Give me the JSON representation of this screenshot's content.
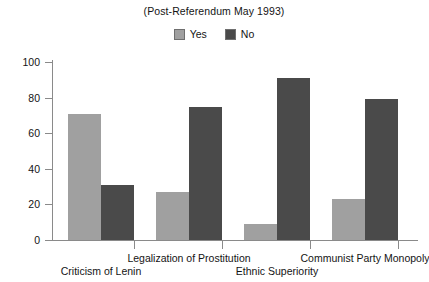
{
  "chart_data": {
    "type": "bar",
    "title": "(Post-Referendum May 1993)",
    "xlabel": "",
    "ylabel": "",
    "ylim": [
      0,
      100
    ],
    "yticks": [
      0,
      20,
      40,
      60,
      80,
      100
    ],
    "grid": false,
    "legend_position": "top-center",
    "categories": [
      "Criticism of Lenin",
      "Legalization of Prostitution",
      "Ethnic Superiority",
      "Communist Party Monopoly"
    ],
    "series": [
      {
        "name": "Yes",
        "color": "#a0a0a0",
        "values": [
          71,
          27,
          9,
          23
        ]
      },
      {
        "name": "No",
        "color": "#4a4a4a",
        "values": [
          31,
          75,
          91,
          79
        ]
      }
    ]
  },
  "legend": {
    "entries": [
      {
        "label": "Yes",
        "color": "#a0a0a0"
      },
      {
        "label": "No",
        "color": "#4a4a4a"
      }
    ]
  },
  "axis": {
    "y_tick_labels": [
      "0",
      "20",
      "40",
      "60",
      "80",
      "100"
    ]
  }
}
